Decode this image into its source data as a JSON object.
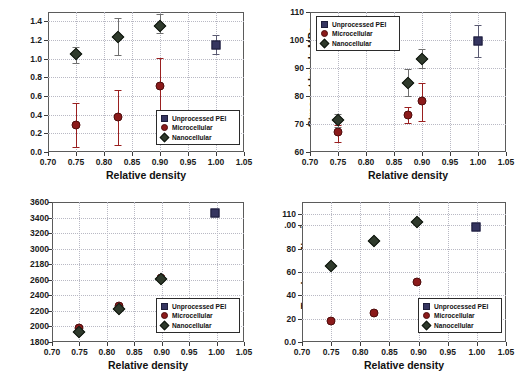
{
  "figure": {
    "background": "#ffffff",
    "colors": {
      "unprocessed": "#353560",
      "microcellular": "#8b1a1a",
      "nanocellular": "#2f3a2c",
      "frame": "#5b5b5b",
      "grid": "#b9b9c4"
    },
    "legend_labels": {
      "unprocessed": "Unprocessed PEI",
      "microcellular": "Microcellular",
      "nanocellular": "Nanocellular"
    },
    "legend_symbols": {
      "unprocessed": "square-marker-icon",
      "microcellular": "circle-marker-icon",
      "nanocellular": "diamond-marker-icon"
    }
  },
  "chart_data": [
    {
      "id": "strain-at-break",
      "type": "scatter",
      "title": "",
      "xlabel": "Relative density",
      "ylabel": "Strain at break mm/mm",
      "xlim": [
        0.7,
        1.05
      ],
      "ylim": [
        0.0,
        1.5
      ],
      "xticks": [
        "0.70",
        "0.75",
        "0.80",
        "0.85",
        "0.90",
        "0.95",
        "1.00",
        "1.05"
      ],
      "xtick_values": [
        0.7,
        0.75,
        0.8,
        0.85,
        0.9,
        0.95,
        1.0,
        1.05
      ],
      "yticks": [
        "0.0",
        "0.2",
        "0.4",
        "0.6",
        "0.8",
        "1.0",
        "1.2",
        "1.4"
      ],
      "ytick_values": [
        0.0,
        0.2,
        0.4,
        0.6,
        0.8,
        1.0,
        1.2,
        1.4
      ],
      "grid": true,
      "legend_position": "lower-right",
      "series": [
        {
          "name": "Unprocessed PEI",
          "marker": "square",
          "color": "#353560",
          "points": [
            {
              "x": 1.0,
              "y": 1.15,
              "err_low": 0.1,
              "err_high": 0.1
            }
          ]
        },
        {
          "name": "Microcellular",
          "marker": "circle",
          "color": "#8b1a1a",
          "points": [
            {
              "x": 0.75,
              "y": 0.29,
              "err_low": 0.24,
              "err_high": 0.24
            },
            {
              "x": 0.825,
              "y": 0.37,
              "err_low": 0.29,
              "err_high": 0.29
            },
            {
              "x": 0.9,
              "y": 0.71,
              "err_low": 0.31,
              "err_high": 0.3
            }
          ]
        },
        {
          "name": "Nanocellular",
          "marker": "diamond",
          "color": "#2f3a2c",
          "points": [
            {
              "x": 0.75,
              "y": 1.05,
              "err_low": 0.1,
              "err_high": 0.07
            },
            {
              "x": 0.825,
              "y": 1.23,
              "err_low": 0.19,
              "err_high": 0.21
            },
            {
              "x": 0.9,
              "y": 1.35,
              "err_low": 0.08,
              "err_high": 0.13
            }
          ]
        }
      ]
    },
    {
      "id": "stress-at-break",
      "type": "scatter",
      "title": "",
      "xlabel": "Relative density",
      "ylabel": "Stress at break, MPa",
      "xlim": [
        0.7,
        1.05
      ],
      "ylim": [
        60,
        110
      ],
      "xticks": [
        "0.70",
        "0.75",
        "0.80",
        "0.85",
        "0.90",
        "0.95",
        "1.00",
        "1.05"
      ],
      "xtick_values": [
        0.7,
        0.75,
        0.8,
        0.85,
        0.9,
        0.95,
        1.0,
        1.05
      ],
      "yticks": [
        "60",
        "70",
        "80",
        "90",
        "100",
        "110"
      ],
      "ytick_values": [
        60,
        70,
        80,
        90,
        100,
        110
      ],
      "grid": true,
      "legend_position": "upper-left",
      "series": [
        {
          "name": "Unprocessed PEI",
          "marker": "square",
          "color": "#353560",
          "points": [
            {
              "x": 1.0,
              "y": 99.8,
              "err_low": 5.8,
              "err_high": 5.6
            }
          ]
        },
        {
          "name": "Microcellular",
          "marker": "circle",
          "color": "#8b1a1a",
          "points": [
            {
              "x": 0.75,
              "y": 67.0,
              "err_low": 3.6,
              "err_high": 2.8
            },
            {
              "x": 0.875,
              "y": 73.3,
              "err_low": 2.9,
              "err_high": 2.8
            },
            {
              "x": 0.9,
              "y": 78.3,
              "err_low": 7.2,
              "err_high": 6.5
            }
          ]
        },
        {
          "name": "Nanocellular",
          "marker": "diamond",
          "color": "#2f3a2c",
          "points": [
            {
              "x": 0.75,
              "y": 71.5,
              "err_low": 2.4,
              "err_high": 2.1
            },
            {
              "x": 0.875,
              "y": 84.8,
              "err_low": 4.7,
              "err_high": 4.9
            },
            {
              "x": 0.9,
              "y": 93.3,
              "err_low": 3.3,
              "err_high": 3.6
            }
          ]
        }
      ]
    },
    {
      "id": "modulus-of-elasticity",
      "type": "scatter",
      "title": "",
      "xlabel": "Relative density",
      "ylabel": "Modulus of Elasticity, MPa",
      "xlim": [
        0.7,
        1.05
      ],
      "ylim": [
        1800,
        3600
      ],
      "xticks": [
        "0.70",
        "0.75",
        "0.80",
        "0.85",
        "0.90",
        "0.95",
        "1.00",
        "1.05"
      ],
      "xtick_values": [
        0.7,
        0.75,
        0.8,
        0.85,
        0.9,
        0.95,
        1.0,
        1.05
      ],
      "yticks": [
        "1800",
        "2000",
        "2200",
        "2400",
        "2600",
        "2180",
        "3000",
        "3200",
        "3400",
        "3600"
      ],
      "ytick_values": [
        1800,
        2000,
        2200,
        2400,
        2600,
        2800,
        3000,
        3200,
        3400,
        3600
      ],
      "grid": true,
      "legend_position": "lower-right",
      "series": [
        {
          "name": "Unprocessed PEI",
          "marker": "square",
          "color": "#353560",
          "points": [
            {
              "x": 0.998,
              "y": 3455
            }
          ]
        },
        {
          "name": "Microcellular",
          "marker": "circle",
          "color": "#8b1a1a",
          "points": [
            {
              "x": 0.75,
              "y": 1985
            },
            {
              "x": 0.823,
              "y": 2265
            },
            {
              "x": 0.898,
              "y": 2620
            }
          ]
        },
        {
          "name": "Nanocellular",
          "marker": "diamond",
          "color": "#2f3a2c",
          "points": [
            {
              "x": 0.75,
              "y": 1935
            },
            {
              "x": 0.823,
              "y": 2228
            },
            {
              "x": 0.898,
              "y": 2612
            }
          ]
        }
      ]
    },
    {
      "id": "toughness",
      "type": "scatter",
      "title": "",
      "xlabel": "Relative density",
      "ylabel": "Toughness J/cm³",
      "xlim": [
        0.7,
        1.05
      ],
      "ylim": [
        0,
        120
      ],
      "xticks": [
        "0.70",
        "0.75",
        "0.80",
        "0.85",
        "0.90",
        "0.95",
        "1.00",
        "1.05"
      ],
      "xtick_values": [
        0.7,
        0.75,
        0.8,
        0.85,
        0.9,
        0.95,
        1.0,
        1.05
      ],
      "yticks": [
        "0.0",
        "20",
        "40",
        "60",
        "80",
        ".00",
        "110"
      ],
      "ytick_values": [
        0,
        20,
        40,
        60,
        80,
        100,
        110
      ],
      "grid": true,
      "legend_position": "lower-right",
      "series": [
        {
          "name": "Unprocessed PEI",
          "marker": "square",
          "color": "#353560",
          "points": [
            {
              "x": 0.998,
              "y": 99
            }
          ]
        },
        {
          "name": "Microcellular",
          "marker": "circle",
          "color": "#8b1a1a",
          "points": [
            {
              "x": 0.75,
              "y": 18
            },
            {
              "x": 0.823,
              "y": 25
            },
            {
              "x": 0.898,
              "y": 51.5
            }
          ]
        },
        {
          "name": "Nanocellular",
          "marker": "diamond",
          "color": "#2f3a2c",
          "points": [
            {
              "x": 0.75,
              "y": 65
            },
            {
              "x": 0.823,
              "y": 86.5
            },
            {
              "x": 0.898,
              "y": 102.5
            }
          ]
        }
      ]
    }
  ]
}
